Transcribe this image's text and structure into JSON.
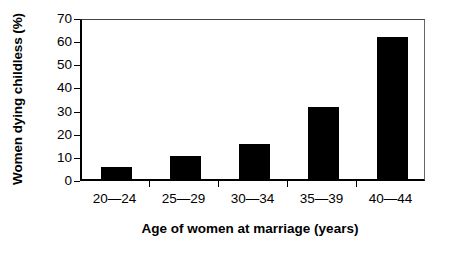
{
  "chart_data": {
    "type": "bar",
    "title": "",
    "xlabel": "Age of women at marriage (years)",
    "ylabel": "Women dying childless (%)",
    "categories": [
      "20—24",
      "25—29",
      "30—34",
      "35—39",
      "40—44"
    ],
    "values": [
      5,
      10,
      15,
      31,
      61.5
    ],
    "ylim": [
      0,
      70
    ],
    "yticks": [
      0,
      10,
      20,
      30,
      40,
      50,
      60,
      70
    ],
    "ytick_labels": [
      "0",
      "10",
      "20",
      "30",
      "40",
      "50",
      "60",
      "70"
    ],
    "grid": false,
    "legend": null,
    "bar_color": "#000000",
    "axis_color": "#000000",
    "background_color": "#ffffff"
  }
}
